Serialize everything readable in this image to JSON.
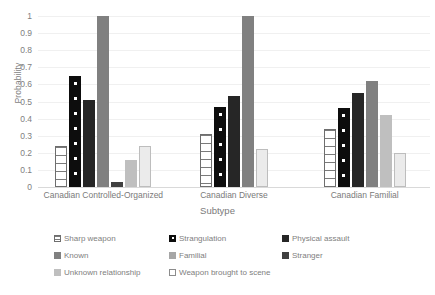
{
  "chart_data": {
    "type": "bar",
    "title": "",
    "xlabel": "Subtype",
    "ylabel": "Probability",
    "ylim": [
      0,
      1
    ],
    "ytick_labels": [
      "1",
      "0.9",
      "0.8",
      "0.7",
      "0.6",
      "0.5",
      "0.4",
      "0.3",
      "0.2",
      "0.1",
      "0"
    ],
    "ytick_values": [
      1,
      0.9,
      0.8,
      0.7,
      0.6,
      0.5,
      0.4,
      0.3,
      0.2,
      0.1,
      0
    ],
    "grid": true,
    "legend_position": "bottom",
    "categories": [
      "Canadian Controlled-Organized",
      "Canadian Diverse",
      "Canadian Familial"
    ],
    "series": [
      {
        "name": "Sharp weapon",
        "fill": "f-sharp",
        "color": "#ffffff",
        "values": [
          0.24,
          0.31,
          0.34
        ]
      },
      {
        "name": "Strangulation",
        "fill": "f-strang",
        "color": "#0d0d0d",
        "values": [
          0.65,
          0.47,
          0.46
        ]
      },
      {
        "name": "Physical assault",
        "fill": "f-phys",
        "color": "#262626",
        "values": [
          0.51,
          0.53,
          0.55
        ]
      },
      {
        "name": "Known",
        "fill": "f-known",
        "color": "#808080",
        "values": [
          1.0,
          1.0,
          0.62
        ]
      },
      {
        "name": "Familial",
        "fill": "f-fam",
        "color": "#a6a6a6",
        "values": [
          null,
          null,
          null
        ]
      },
      {
        "name": "Stranger",
        "fill": "f-stranger",
        "color": "#404040",
        "values": [
          0.03,
          null,
          null
        ]
      },
      {
        "name": "Unknown relationship",
        "fill": "f-unkrel",
        "color": "#bfbfbf",
        "values": [
          0.16,
          null,
          0.42
        ]
      },
      {
        "name": "Weapon brought to scene",
        "fill": "f-weapon",
        "color": "#ebebeb",
        "values": [
          0.24,
          0.22,
          0.2
        ]
      }
    ]
  },
  "legend": {
    "items": [
      {
        "label": "Sharp weapon",
        "fill": "f-sharp"
      },
      {
        "label": "Strangulation",
        "fill": "f-strang"
      },
      {
        "label": "Physical assault",
        "fill": "f-phys"
      },
      {
        "label": "Known",
        "fill": "f-known"
      },
      {
        "label": "Familial",
        "fill": "f-fam"
      },
      {
        "label": "Stranger",
        "fill": "f-stranger"
      },
      {
        "label": "Unknown relationship",
        "fill": "f-unkrel"
      },
      {
        "label": "Weapon brought to scene",
        "fill": "f-weapon"
      }
    ]
  }
}
